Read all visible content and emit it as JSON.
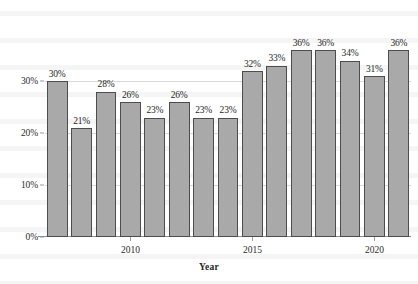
{
  "chart_data": {
    "type": "bar",
    "title": "",
    "subtitle": "",
    "xlabel": "Year",
    "ylabel": "",
    "categories": [
      "2007",
      "2008",
      "2009",
      "2010",
      "2011",
      "2012",
      "2013",
      "2014",
      "2015",
      "2016",
      "2017",
      "2018",
      "2019",
      "2020",
      "2021"
    ],
    "values": [
      30,
      21,
      28,
      26,
      23,
      26,
      23,
      23,
      32,
      33,
      36,
      36,
      34,
      31,
      36
    ],
    "data_labels": [
      "30%",
      "21%",
      "28%",
      "26%",
      "23%",
      "26%",
      "23%",
      "23%",
      "32%",
      "33%",
      "36%",
      "36%",
      "34%",
      "31%",
      "36%"
    ],
    "ylim": [
      0,
      38
    ],
    "y_ticks": [
      0,
      10,
      20,
      30
    ],
    "y_tick_labels": [
      "0%",
      "10%",
      "20%",
      "30%"
    ],
    "x_ticks": [
      "2010",
      "2015",
      "2020"
    ],
    "x_tick_indices": [
      3,
      8,
      13
    ],
    "grid": true,
    "grid_axis": "y",
    "legend": null,
    "legend_position": "none",
    "bar_color": "#a9a9a9",
    "bar_edge_color": "#4d4d4d",
    "grid_color": "#d9d9d9",
    "axis_color": "#8d8d8d",
    "text_color": "#1f1f1f"
  }
}
